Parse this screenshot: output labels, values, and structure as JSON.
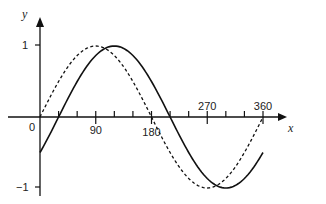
{
  "chart_data": {
    "type": "line",
    "title": "",
    "xlabel": "x",
    "ylabel": "y",
    "xlim": [
      0,
      360
    ],
    "ylim": [
      -1,
      1
    ],
    "x_ticks": [
      0,
      30,
      60,
      90,
      120,
      150,
      180,
      210,
      240,
      270,
      300,
      330,
      360
    ],
    "x_tick_labels": [
      {
        "value": 0,
        "label": "0"
      },
      {
        "value": 90,
        "label": "90"
      },
      {
        "value": 180,
        "label": "180"
      },
      {
        "value": 270,
        "label": "270"
      },
      {
        "value": 360,
        "label": "360"
      }
    ],
    "y_tick_labels": [
      {
        "value": 1,
        "label": "1"
      },
      {
        "value": -1,
        "label": "−1"
      }
    ],
    "grid": false,
    "legend": null,
    "x": [
      0,
      30,
      60,
      90,
      120,
      150,
      180,
      210,
      240,
      270,
      300,
      330,
      360
    ],
    "series": [
      {
        "name": "y = sin x",
        "style": "dashed",
        "color": "#111111",
        "values": [
          0,
          0.5,
          0.866,
          1,
          0.866,
          0.5,
          0,
          -0.5,
          -0.866,
          -1,
          -0.866,
          -0.5,
          0
        ]
      },
      {
        "name": "y = sin(x − 30°)",
        "style": "solid",
        "color": "#111111",
        "values": [
          -0.5,
          0,
          0.5,
          0.866,
          1,
          0.866,
          0.5,
          0,
          -0.5,
          -0.866,
          -1,
          -0.866,
          -0.5
        ]
      }
    ]
  },
  "labels": {
    "x_axis": "x",
    "y_axis": "y",
    "origin": "0",
    "y_pos_one": "1",
    "y_neg_one": "−1"
  }
}
